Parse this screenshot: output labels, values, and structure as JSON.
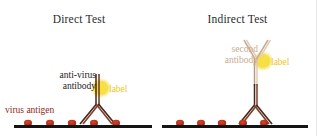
{
  "figure": {
    "width": 317,
    "height": 136,
    "background": "#ffffff",
    "border_color": "#e8e8e8"
  },
  "colors": {
    "title_text": "#2b2b2b",
    "antibody_dark": "#4a2318",
    "antibody_primary": "#5c2b1c",
    "antibody_second_pale": "#d8bda8",
    "label_circle_fill": "#f5dd3c",
    "label_circle_glow": "#faea86",
    "label_text": "#f0c41b",
    "antigen_dot": "#b52a16",
    "antigen_dot_core": "#d13c1e",
    "baseline": "#141414",
    "virus_antigen_text": "#8e2a18",
    "anti_virus_text": "#1c1c1c",
    "second_antibody_text": "#c9ab93"
  },
  "panels": [
    {
      "id": "direct",
      "title": "Direct Test",
      "captions": {
        "antibody_line1": "anti-virus",
        "antibody_line2": "antibody",
        "label": "label",
        "antigen": "virus antigen"
      },
      "antigen_dots_x": [
        28,
        50,
        72,
        94,
        116
      ],
      "baseline": {
        "x1": 14,
        "x2": 152,
        "y": 126
      }
    },
    {
      "id": "indirect",
      "title": "Indirect Test",
      "captions": {
        "second_antibody_line1": "second",
        "second_antibody_line2": "antibody",
        "label": "label"
      },
      "antigen_dots_x": [
        22,
        43,
        64,
        85,
        106
      ],
      "baseline": {
        "x1": 4,
        "x2": 150,
        "y": 126
      }
    }
  ],
  "diagram_meta": {
    "type": "immunoassay-schematic",
    "comparison": "Direct Test vs Indirect Test"
  }
}
